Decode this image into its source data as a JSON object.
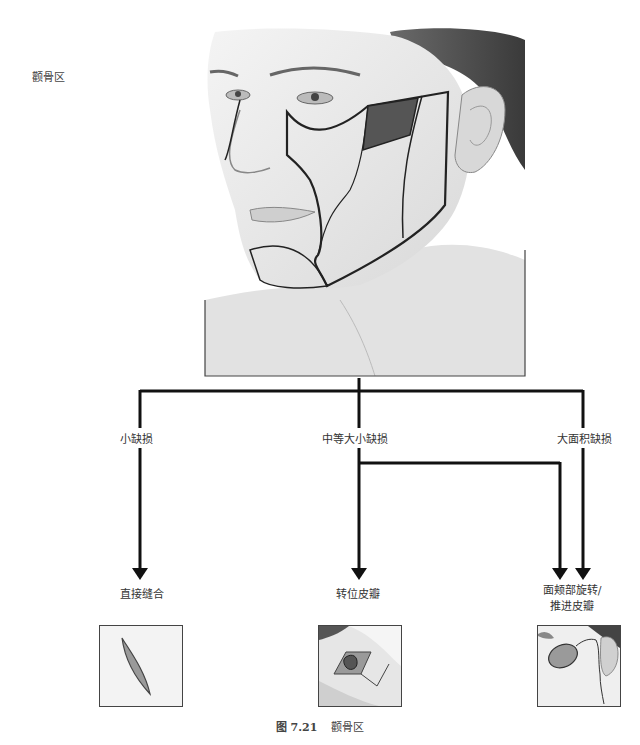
{
  "side_label": "颧骨区",
  "illustration": {
    "subject": "face-with-cheek-subunit-outlines",
    "highlight_color": "#555555"
  },
  "flowchart": {
    "branches": [
      {
        "label": "小缺损",
        "result": "直接缝合",
        "thumbnail": "elliptical-excision"
      },
      {
        "label": "中等大小缺损",
        "result": "转位皮瓣",
        "thumbnail": "transposition-flap"
      },
      {
        "label": "大面积缺损",
        "result_line1": "面颊部旋转/",
        "result_line2": "推进皮瓣",
        "thumbnail": "cheek-rotation-advancement-flap"
      }
    ],
    "line_color": "#111111",
    "fill_color": "#8a8a8a"
  },
  "caption": {
    "figure_number": "图 7.21",
    "title": "颧骨区"
  }
}
